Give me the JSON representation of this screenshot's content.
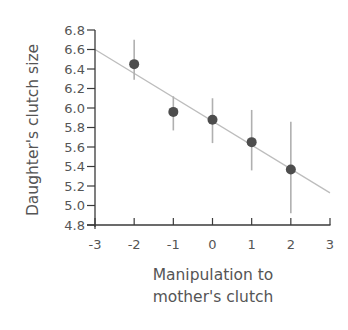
{
  "chart_data": {
    "type": "scatter",
    "title": "",
    "xlabel": "Manipulation to mother's clutch",
    "xlabel_lines": [
      "Manipulation to",
      "mother's clutch"
    ],
    "ylabel": "Daughter's clutch size",
    "xlim": [
      -3,
      3
    ],
    "ylim": [
      4.8,
      6.8
    ],
    "x_ticks": [
      -3,
      -2,
      -1,
      0,
      1,
      2,
      3
    ],
    "x_tick_labels": [
      "-3",
      "-2",
      "-1",
      "0",
      "1",
      "2",
      "3"
    ],
    "y_ticks": [
      4.8,
      5.0,
      5.2,
      5.4,
      5.6,
      5.8,
      6.0,
      6.2,
      6.4,
      6.6,
      6.8
    ],
    "y_tick_labels": [
      "4.8",
      "5.0",
      "5.2",
      "5.4",
      "5.6",
      "5.8",
      "6.0",
      "6.2",
      "6.4",
      "6.6",
      "6.8"
    ],
    "grid": false,
    "legend": null,
    "series": [
      {
        "name": "Mean daughter's clutch size",
        "x": [
          -2,
          -1,
          0,
          1,
          2
        ],
        "y": [
          6.45,
          5.96,
          5.88,
          5.65,
          5.37
        ],
        "error_low": [
          6.29,
          5.77,
          5.64,
          5.36,
          4.92
        ],
        "error_high": [
          6.7,
          6.12,
          6.1,
          5.98,
          5.86
        ]
      }
    ],
    "regression_line": {
      "x": [
        -3,
        3
      ],
      "y": [
        6.6,
        5.13
      ]
    }
  },
  "colors": {
    "axis": "#3a3a3a",
    "point": "#4d4d4d",
    "error_bar": "#b0b0b0",
    "regression": "#bdbdbd",
    "text": "#555555"
  }
}
